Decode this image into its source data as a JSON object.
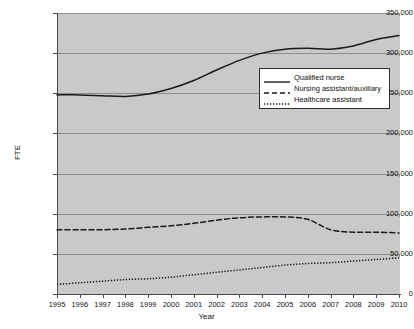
{
  "chart_data": {
    "type": "line",
    "title": "",
    "xlabel": "Year",
    "ylabel": "FTE",
    "x": [
      1995,
      1996,
      1997,
      1998,
      1999,
      2000,
      2001,
      2002,
      2003,
      2004,
      2005,
      2006,
      2007,
      2008,
      2009,
      2010
    ],
    "xlim": [
      1995,
      2010
    ],
    "ylim": [
      0,
      350000
    ],
    "yticks": [
      0,
      50000,
      100000,
      150000,
      200000,
      250000,
      300000,
      350000
    ],
    "ytick_labels": [
      "0",
      "50,000",
      "100,000",
      "150,000",
      "200,000",
      "250,000",
      "300,000",
      "350,000"
    ],
    "xtick_labels": [
      "1995",
      "1996",
      "1997",
      "1998",
      "1999",
      "2000",
      "2001",
      "2002",
      "2003",
      "2004",
      "2005",
      "2006",
      "2007",
      "2008",
      "2009",
      "2010"
    ],
    "grid": "horizontal",
    "legend_position": "upper-right-inside",
    "plot_background": "#c9c9c9",
    "series": [
      {
        "name": "Qualified nurse",
        "style": "solid",
        "color": "#1a1a1a",
        "values": [
          248000,
          248000,
          247000,
          246000,
          249000,
          256000,
          266000,
          279000,
          291000,
          300000,
          305000,
          306000,
          305000,
          309000,
          317000,
          322000
        ]
      },
      {
        "name": "Nursing assistant/auxiliary",
        "style": "dashed",
        "color": "#1a1a1a",
        "values": [
          80000,
          80000,
          80000,
          81000,
          83000,
          85000,
          88000,
          92000,
          95000,
          96000,
          96000,
          93000,
          80000,
          77000,
          77000,
          76000
        ]
      },
      {
        "name": "Healthcare assistant",
        "style": "dotted",
        "color": "#1a1a1a",
        "values": [
          12000,
          14000,
          16000,
          18000,
          19000,
          21000,
          24000,
          27000,
          30000,
          33000,
          36000,
          38000,
          39000,
          41000,
          43000,
          45000
        ]
      }
    ]
  },
  "axes": {
    "y_title": "FTE",
    "x_title": "Year"
  },
  "legend": {
    "items": [
      {
        "label": "Qualified nurse",
        "style": "solid"
      },
      {
        "label": "Nursing assistant/auxiliary",
        "style": "dashed"
      },
      {
        "label": "Healthcare assistant",
        "style": "dotted"
      }
    ]
  }
}
